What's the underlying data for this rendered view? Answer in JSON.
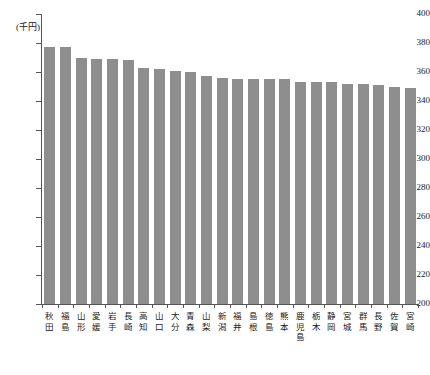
{
  "chart_data": {
    "type": "bar",
    "title": "",
    "subtitle": "",
    "xlabel": "",
    "ylabel": "",
    "unit_label": "(千円)",
    "ylim": [
      200,
      400
    ],
    "ytick_step": 20,
    "yticks": [
      400,
      380,
      360,
      340,
      320,
      300,
      280,
      260,
      240,
      220,
      200
    ],
    "ytick_labels": [
      "400",
      "380",
      "360",
      "340",
      "320",
      "300",
      "280",
      "260",
      "240",
      "220",
      "200"
    ],
    "grid": false,
    "legend": null,
    "bar_color": "#8e8e8e",
    "axis_color": "#555555",
    "categories": [
      "秋田",
      "福島",
      "山形",
      "愛媛",
      "岩手",
      "長崎",
      "高知",
      "山口",
      "大分",
      "青森",
      "山梨",
      "新潟",
      "福井",
      "島根",
      "徳島",
      "熊本",
      "鹿児島",
      "栃木",
      "静岡",
      "宮城",
      "群馬",
      "長野",
      "佐賀",
      "宮崎"
    ],
    "values": [
      377,
      377,
      370,
      369,
      369,
      368,
      363,
      362,
      361,
      360,
      357,
      356,
      355,
      355,
      355,
      355,
      353,
      353,
      353,
      352,
      352,
      351,
      350,
      349
    ]
  }
}
